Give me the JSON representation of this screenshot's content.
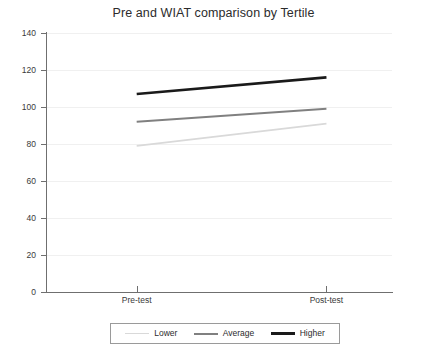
{
  "chart_data": {
    "type": "line",
    "title": "Pre and WIAT comparison by Tertile",
    "subtitle": "",
    "xlabel": "",
    "ylabel": "",
    "categories": [
      "Pre-test",
      "Post-test"
    ],
    "x": [
      0,
      1
    ],
    "ylim": [
      0,
      140
    ],
    "yticks": [
      0,
      20,
      40,
      60,
      80,
      100,
      120,
      140
    ],
    "ytick_labels": [
      "0",
      "20",
      "40",
      "60",
      "80",
      "100",
      "120",
      "140"
    ],
    "grid": true,
    "grid_axis": "y",
    "legend_position": "bottom",
    "series": [
      {
        "name": "Lower",
        "values": [
          79,
          91
        ],
        "color": "#d9d9d9",
        "width": 1.6
      },
      {
        "name": "Average",
        "values": [
          92,
          99
        ],
        "color": "#808080",
        "width": 2.0
      },
      {
        "name": "Higher",
        "values": [
          107,
          116
        ],
        "color": "#1a1a1a",
        "width": 2.6
      }
    ]
  },
  "legend": {
    "entries": [
      {
        "label": "Lower",
        "color": "#d9d9d9",
        "width": "1.6px"
      },
      {
        "label": "Average",
        "color": "#808080",
        "width": "2.2px"
      },
      {
        "label": "Higher",
        "color": "#1a1a1a",
        "width": "3px"
      }
    ]
  }
}
